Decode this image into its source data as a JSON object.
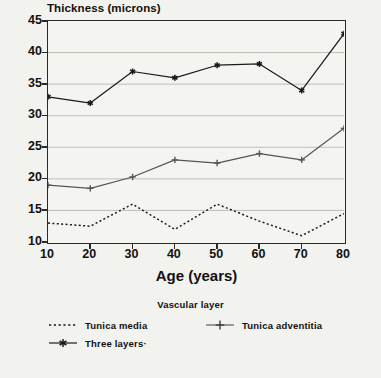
{
  "chart_data": {
    "type": "line",
    "title": "",
    "xlabel": "Age (years)",
    "ylabel": "Thickness (microns)",
    "x": [
      10,
      20,
      30,
      40,
      50,
      60,
      70,
      80
    ],
    "xlim": [
      10,
      80
    ],
    "ylim": [
      10,
      45
    ],
    "xticks": [
      10,
      20,
      30,
      40,
      50,
      60,
      70,
      80
    ],
    "yticks": [
      10,
      15,
      20,
      25,
      30,
      35,
      40,
      45
    ],
    "grid": "horizontal",
    "legend_title": "Vascular layer",
    "legend_position": "bottom",
    "series": [
      {
        "name": "Tunica media",
        "values": [
          13,
          12.5,
          16,
          12,
          16,
          13.3,
          11,
          14.5
        ],
        "line_style": "dotted",
        "marker": "none",
        "color": "#1a1a1a"
      },
      {
        "name": "Tunica adventitia",
        "values": [
          19,
          18.5,
          20.3,
          23,
          22.5,
          24,
          23,
          28
        ],
        "line_style": "solid",
        "marker": "plus",
        "color": "#555555"
      },
      {
        "name": "Three layers·",
        "values": [
          33,
          32,
          37,
          36,
          38,
          38.2,
          34,
          43
        ],
        "line_style": "solid",
        "marker": "asterisk",
        "color": "#1a1a1a"
      }
    ]
  },
  "axes": {
    "y_title": "Thickness (microns)",
    "x_title": "Age (years)",
    "y_tick_labels": [
      "45",
      "40",
      "35",
      "30",
      "25",
      "20",
      "15",
      "10"
    ],
    "x_tick_labels": [
      "10",
      "20",
      "30",
      "40",
      "50",
      "60",
      "70",
      "80"
    ]
  },
  "legend": {
    "title": "Vascular layer",
    "entries": [
      {
        "label": "Tunica media",
        "marker": "dotted-line"
      },
      {
        "label": "Tunica adventitia",
        "marker": "plus-marker"
      },
      {
        "label": "Three layers·",
        "marker": "asterisk-marker"
      }
    ]
  },
  "colors": {
    "background": "#f2f2ef",
    "plot_background": "#f4f4f1",
    "axis": "#2a2a2a",
    "grid": "#b9b9b4",
    "text": "#111111"
  }
}
